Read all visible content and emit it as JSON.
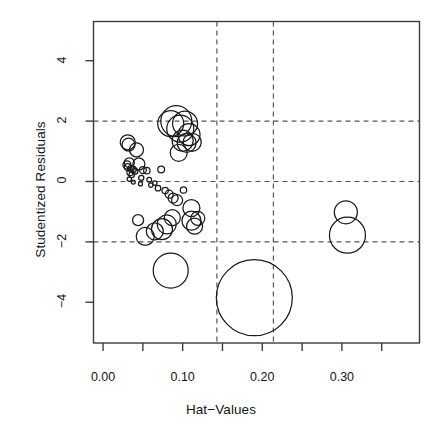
{
  "figure": {
    "kind": "influence-plot",
    "background_color": "#ffffff",
    "frame_color": "#3c3c3c",
    "bubble_color": "#1a1a1a",
    "guide_color": "#555555"
  },
  "chart_data": {
    "type": "scatter",
    "title": "",
    "xlabel": "Hat-Values",
    "ylabel": "Studentized Residuals",
    "xlim": [
      -0.012,
      0.3975
    ],
    "ylim": [
      -5.35,
      5.3
    ],
    "grid": false,
    "legend": null,
    "xticks": [
      0.0,
      0.05,
      0.1,
      0.15,
      0.2,
      0.25,
      0.3,
      0.35
    ],
    "xtick_labels": [
      "0.00",
      "",
      "0.10",
      "",
      "0.20",
      "",
      "0.30",
      ""
    ],
    "yticks": [
      4,
      2,
      0,
      -2,
      -4
    ],
    "ytick_labels": [
      "4",
      "2",
      "0",
      "-2",
      "-4"
    ],
    "reference_lines": {
      "horizontal": [
        2,
        0,
        -2
      ],
      "vertical": [
        0.143,
        0.214
      ],
      "style": "dashed"
    },
    "point_size_meaning": "Cook's distance",
    "x": [
      0.031,
      0.032,
      0.033,
      0.042,
      0.03,
      0.031,
      0.035,
      0.045,
      0.038,
      0.034,
      0.036,
      0.04,
      0.05,
      0.055,
      0.048,
      0.058,
      0.065,
      0.073,
      0.085,
      0.092,
      0.097,
      0.103,
      0.108,
      0.1,
      0.095,
      0.105,
      0.112,
      0.033,
      0.038,
      0.047,
      0.06,
      0.069,
      0.078,
      0.083,
      0.088,
      0.093,
      0.101,
      0.111,
      0.119,
      0.044,
      0.053,
      0.065,
      0.074,
      0.08,
      0.087,
      0.111,
      0.115,
      0.085,
      0.19,
      0.305,
      0.307
    ],
    "y": [
      1.3,
      1.22,
      0.62,
      1.05,
      0.55,
      0.48,
      0.42,
      0.58,
      0.4,
      0.3,
      0.22,
      0.34,
      0.38,
      0.36,
      0.12,
      0.06,
      -0.05,
      0.4,
      1.92,
      2.0,
      1.75,
      1.92,
      1.55,
      1.35,
      0.95,
      1.28,
      1.3,
      0.08,
      -0.02,
      -0.08,
      -0.12,
      -0.22,
      -0.3,
      -0.42,
      -0.55,
      -0.62,
      -0.28,
      -0.88,
      -1.22,
      -1.28,
      -1.82,
      -1.65,
      -1.58,
      -1.42,
      -1.2,
      -1.3,
      -1.48,
      -2.95,
      -3.85,
      -1.02,
      -1.78
    ],
    "sizes_px": [
      7.5,
      6.5,
      5.0,
      7.0,
      4.0,
      3.5,
      3.2,
      6.0,
      3.0,
      3.2,
      2.8,
      3.0,
      3.5,
      3.2,
      2.6,
      2.4,
      2.2,
      3.4,
      13.0,
      15.5,
      13.5,
      12.5,
      11.0,
      10.5,
      8.5,
      9.5,
      9.0,
      2.2,
      2.0,
      2.0,
      2.2,
      2.8,
      3.2,
      4.0,
      5.0,
      5.5,
      3.2,
      8.5,
      7.0,
      5.5,
      9.0,
      8.5,
      10.5,
      9.5,
      8.0,
      9.5,
      8.0,
      17.5,
      38.0,
      11.5,
      18.0
    ]
  },
  "axes": {
    "x_title": "Hat−Values",
    "y_title": "Studentized Residuals",
    "x_labels": [
      "0.00",
      "0.10",
      "0.20",
      "0.30"
    ],
    "y_labels": [
      "4",
      "2",
      "0",
      "−2",
      "−4"
    ]
  }
}
